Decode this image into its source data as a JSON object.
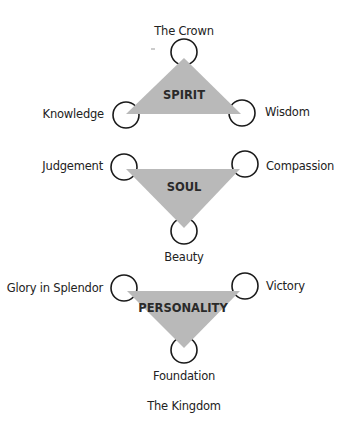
{
  "colors": {
    "triangle_fill": "#b9b9b9",
    "circle_stroke": "#1a1a1a",
    "text": "#222222"
  },
  "groups": [
    {
      "name": "SPIRIT",
      "orientation": "up",
      "nodes": [
        "The Crown",
        "Knowledge",
        "Wisdom"
      ]
    },
    {
      "name": "SOUL",
      "orientation": "down",
      "nodes": [
        "Judgement",
        "Compassion",
        "Beauty"
      ]
    },
    {
      "name": "PERSONALITY",
      "orientation": "down",
      "nodes": [
        "Glory in Splendor",
        "Victory",
        "Foundation"
      ]
    }
  ],
  "labels": {
    "crown": "The Crown",
    "knowledge": "Knowledge",
    "wisdom": "Wisdom",
    "judgement": "Judgement",
    "compassion": "Compassion",
    "beauty": "Beauty",
    "glory": "Glory in Splendor",
    "victory": "Victory",
    "foundation": "Foundation",
    "kingdom": "The Kingdom"
  },
  "triangles": {
    "spirit": "SPIRIT",
    "soul": "SOUL",
    "personality": "PERSONALITY"
  }
}
